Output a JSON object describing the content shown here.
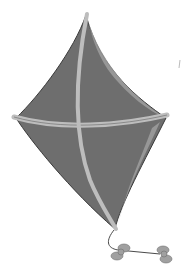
{
  "image": {
    "subject": "kite",
    "description": "Grayscale illustration of a diamond-shaped kite with crossed spars and a short tail with bows",
    "colors": {
      "background": "#ffffff",
      "kite_body": "#6e6e6e",
      "kite_body_dark": "#5a5a5a",
      "kite_highlight": "#a8a8a8",
      "spar": "#bdbdbd",
      "outline": "#3a3a3a",
      "bow": "#a0a0a0",
      "string": "#4a4a4a"
    }
  }
}
